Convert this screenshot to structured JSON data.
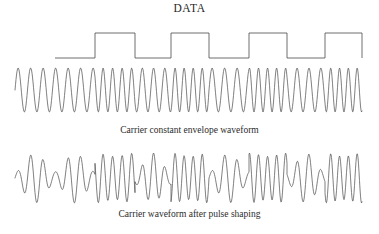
{
  "figure": {
    "title": "DATA",
    "caption_top": "Carrier constant envelope waveform",
    "caption_bottom": "Carrier waveform after pulse shaping",
    "stroke_color": "#4a4a4a",
    "wave_color": "#555555",
    "background_color": "#ffffff"
  },
  "chart_data": {
    "type": "line",
    "title": "DATA",
    "xlabel": "",
    "ylabel": "",
    "grid": false,
    "legend": "none",
    "panels": [
      {
        "name": "data-square-wave",
        "label": "DATA",
        "type": "line",
        "description": "Binary NRZ data square wave, two levels",
        "xlim": [
          55,
          362
        ],
        "ylim": [
          58,
          33
        ],
        "levels": {
          "low_y": 58,
          "high_y": 33
        },
        "bits": [
          0,
          1,
          0,
          1,
          0,
          1,
          0,
          1
        ],
        "transitions_x": [
          55,
          95,
          135,
          171,
          209,
          249,
          287,
          325,
          362
        ],
        "points": [
          [
            55,
            58
          ],
          [
            95,
            58
          ],
          [
            95,
            33
          ],
          [
            135,
            33
          ],
          [
            135,
            58
          ],
          [
            171,
            58
          ],
          [
            171,
            33
          ],
          [
            209,
            33
          ],
          [
            209,
            58
          ],
          [
            249,
            58
          ],
          [
            249,
            33
          ],
          [
            287,
            33
          ],
          [
            287,
            58
          ],
          [
            325,
            58
          ],
          [
            325,
            33
          ],
          [
            362,
            33
          ],
          [
            362,
            58
          ]
        ]
      },
      {
        "name": "carrier-constant-envelope",
        "label": "Carrier constant envelope waveform",
        "type": "line",
        "description": "Constant amplitude frequency-shift-keyed carrier; frequency follows the DATA bits",
        "xlim": [
          15,
          365
        ],
        "ylim": [
          -1,
          1
        ],
        "center_y": 90,
        "amplitude": 22,
        "cycles_low_bit": 3,
        "cycles_high_bit": 4,
        "segment_boundaries_x": [
          15,
          55,
          95,
          135,
          171,
          209,
          249,
          287,
          325,
          362
        ],
        "segment_bits": [
          0,
          0,
          1,
          0,
          1,
          0,
          1,
          0,
          1
        ]
      },
      {
        "name": "carrier-after-pulse-shaping",
        "label": "Carrier waveform after pulse shaping",
        "type": "line",
        "description": "Same carrier after pulse shaping; envelope is no longer constant and dips between symbols",
        "xlim": [
          15,
          365
        ],
        "ylim": [
          -1,
          1
        ],
        "center_y": 178,
        "amplitude": 25,
        "envelope_min": 0.25,
        "envelope_max": 1.0,
        "segment_boundaries_x": [
          15,
          55,
          95,
          135,
          171,
          209,
          249,
          287,
          325,
          362
        ],
        "segment_bits": [
          0,
          0,
          1,
          0,
          1,
          0,
          1,
          0,
          1
        ]
      }
    ]
  }
}
